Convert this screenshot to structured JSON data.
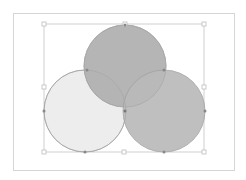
{
  "canvas": {
    "background": "#ffffff",
    "frame_color": "#d6d6d6",
    "selection_color": "#cfcfcf"
  },
  "diagram": {
    "type": "venn",
    "circles": [
      {
        "name": "top",
        "cx": 125,
        "cy": 66,
        "r": 41,
        "fill": "#b3b3b3",
        "stroke": "#9e9e9e"
      },
      {
        "name": "left",
        "cx": 85,
        "cy": 111,
        "r": 41,
        "fill": "#ededed",
        "stroke": "#9e9e9e"
      },
      {
        "name": "right",
        "cx": 164,
        "cy": 111,
        "r": 41,
        "fill": "#bababa",
        "stroke": "#9e9e9e"
      }
    ],
    "selection_box": {
      "x": 44,
      "y": 24,
      "w": 160,
      "h": 128
    },
    "handles": [
      {
        "x": 44,
        "y": 24
      },
      {
        "x": 125,
        "y": 24
      },
      {
        "x": 204,
        "y": 24
      },
      {
        "x": 44,
        "y": 87
      },
      {
        "x": 204,
        "y": 87
      },
      {
        "x": 44,
        "y": 152
      },
      {
        "x": 124,
        "y": 152
      },
      {
        "x": 204,
        "y": 152
      }
    ]
  }
}
